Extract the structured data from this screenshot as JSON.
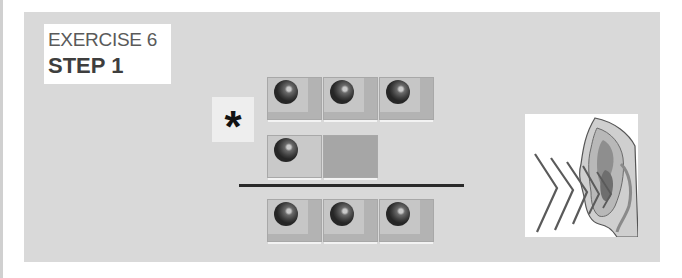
{
  "header": {
    "exercise_label": "EXERCISE 6",
    "step_label": "STEP 1"
  },
  "operator": {
    "symbol": "*",
    "icon": "asterisk-multiply-icon"
  },
  "rows": {
    "top": {
      "tiles": [
        {
          "ball": true
        },
        {
          "ball": true
        },
        {
          "ball": true
        }
      ],
      "count": 3
    },
    "middle": {
      "tiles": [
        {
          "ball": true
        },
        {
          "ball": false
        }
      ],
      "count": 1
    },
    "result": {
      "tiles": [
        {
          "ball": true
        },
        {
          "ball": true
        },
        {
          "ball": true
        }
      ],
      "count": 3
    }
  },
  "illustration": {
    "icon": "ear-listening-icon"
  },
  "colors": {
    "panel": "#d9d9d9",
    "tile_light": "#c6c6c6",
    "tile_dark": "#b3b3b3",
    "tile_empty": "#a6a6a6",
    "ball": "#333333",
    "rule": "#2a2a2a"
  }
}
